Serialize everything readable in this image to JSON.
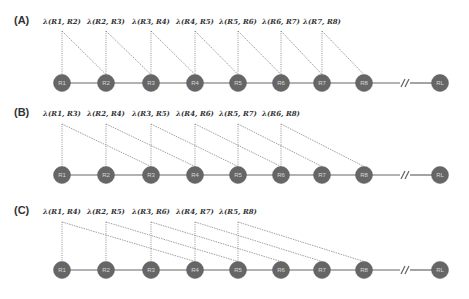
{
  "colors": {
    "node_fill": "#666666",
    "line": "#777777",
    "text": "#333333",
    "node_text": "#d8d8d8"
  },
  "node_x": [
    62,
    106,
    151,
    195,
    238,
    281,
    322,
    364
  ],
  "last_node_x": 440,
  "last_node_label": "RL",
  "break_x": 404,
  "panels": [
    {
      "label": "(A)",
      "label_y": 24,
      "lambda_y": 24,
      "line_top": 31,
      "node_y": 83,
      "offset": 1,
      "nodes": [
        "R1",
        "R2",
        "R3",
        "R4",
        "R5",
        "R6",
        "R7",
        "R8"
      ],
      "lambdas": [
        "λ(R1, R2)",
        "λ(R2, R3)",
        "λ(R3, R4)",
        "λ(R4, R5)",
        "λ(R5, R6)",
        "λ(R6, R7)",
        "λ(R7, R8)"
      ]
    },
    {
      "label": "(B)",
      "label_y": 116,
      "lambda_y": 116,
      "line_top": 124,
      "node_y": 175,
      "offset": 2,
      "nodes": [
        "R1",
        "R2",
        "R3",
        "R4",
        "R5",
        "R6",
        "R7",
        "R8"
      ],
      "lambdas": [
        "λ(R1, R3)",
        "λ(R2, R4)",
        "λ(R3, R5)",
        "λ(R4, R6)",
        "λ(R5, R7)",
        "λ(R6, R8)"
      ]
    },
    {
      "label": "(C)",
      "label_y": 214,
      "lambda_y": 214,
      "line_top": 222,
      "node_y": 270,
      "offset": 3,
      "nodes": [
        "R1",
        "R2",
        "R3",
        "R4",
        "R5",
        "R6",
        "R7",
        "R8"
      ],
      "lambdas": [
        "λ(R1, R4)",
        "λ(R2, R5)",
        "λ(R3, R6)",
        "λ(R4, R7)",
        "λ(R5, R8)"
      ]
    }
  ]
}
